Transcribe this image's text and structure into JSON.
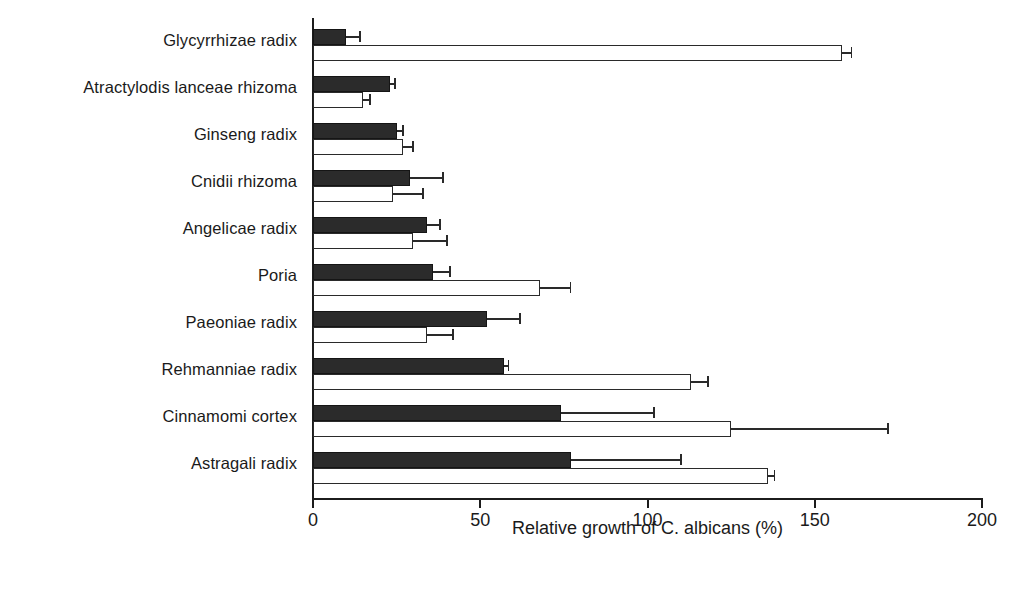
{
  "chart_data": {
    "type": "bar",
    "orientation": "horizontal",
    "title": "",
    "xlabel": "Relative growth of C. albicans (%)",
    "ylabel": "",
    "xlim": [
      0,
      200
    ],
    "xticks": [
      0,
      50,
      100,
      150,
      200
    ],
    "xtick_labels": [
      "0",
      "50",
      "100",
      "150",
      "200"
    ],
    "grid": false,
    "legend": null,
    "categories": [
      "Glycyrrhizae radix",
      "Atractylodis lanceae rhizoma",
      "Ginseng radix",
      "Cnidii  rhizoma",
      "Angelicae radix",
      "Poria",
      "Paeoniae radix",
      "Rehmanniae radix",
      "Cinnamomi cortex",
      "Astragali radix"
    ],
    "series": [
      {
        "name": "filled",
        "style": "solid-black",
        "values": [
          10,
          23,
          25,
          29,
          34,
          36,
          52,
          57,
          74,
          77
        ],
        "errors": [
          4,
          1.5,
          2,
          10,
          4,
          5,
          10,
          1.5,
          28,
          33
        ]
      },
      {
        "name": "open",
        "style": "white-outline",
        "values": [
          158,
          15,
          27,
          24,
          30,
          68,
          34,
          113,
          125,
          136
        ],
        "errors": [
          3,
          2,
          3,
          9,
          10,
          9,
          8,
          5,
          47,
          2
        ]
      }
    ]
  }
}
